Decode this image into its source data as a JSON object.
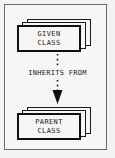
{
  "diagram": {
    "background_color": "#f4f3f1",
    "frame_color": "#6a6a6a",
    "ink_color": "#1a1a1a",
    "nodes": [
      {
        "id": "given-class",
        "line1": "GIVEN",
        "line2": "CLASS",
        "shape": "stacked-rectangle",
        "stack_layers": 3,
        "position": "top"
      },
      {
        "id": "parent-class",
        "line1": "PARENT",
        "line2": "CLASS",
        "shape": "stacked-rectangle",
        "stack_layers": 3,
        "position": "bottom"
      }
    ],
    "connector": {
      "label": "INHERITS FROM",
      "line_style": "dotted",
      "arrowhead": "solid-triangle",
      "direction": "downward",
      "from": "given-class",
      "to": "parent-class"
    }
  }
}
